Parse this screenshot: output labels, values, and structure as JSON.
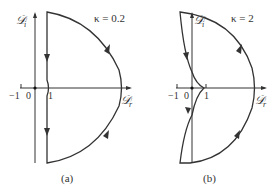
{
  "panels": [
    {
      "id": "a",
      "caption": "(a)",
      "kappa_label": "κ = 0.2",
      "y_axis_label": "𝒟",
      "y_axis_sub": "i",
      "x_axis_label": "𝒟",
      "x_axis_sub": "r",
      "ticks": {
        "minus_one": "−1",
        "zero": "0",
        "one": "1"
      }
    },
    {
      "id": "b",
      "caption": "(b)",
      "kappa_label": "κ = 2",
      "y_axis_label": "𝒟",
      "y_axis_sub": "i",
      "x_axis_label": "𝒟",
      "x_axis_sub": "r",
      "ticks": {
        "minus_one": "−1",
        "zero": "0",
        "one": "1"
      }
    }
  ],
  "colors": {
    "curve": "#333333",
    "axis": "#333333"
  }
}
